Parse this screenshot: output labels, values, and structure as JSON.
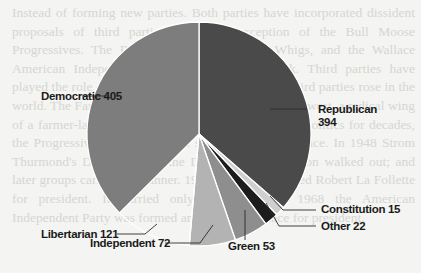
{
  "background_text": "Instead of forming new parties. Both parties have incorporated dissident proposals of third parties, with the exception of the Bull Moose Progressives. The Republicans absorbed the Whigs, and the Wallace American Independents brought Democrats back. Third parties have played the role of protest. In the twentieth century, third parties rose in the world. The Farm Labor Party formed in the upper Midwest, a radical wing of a farmer-labor movement that became the way of politics for decades, the Progressives won 1948 as a splinter. Henry Wallace. In 1948 Strom Thurmond's Dixiecrats and the Democratic convention walked out; and later groups carried the banner. 1924, which nominated Robert La Follette for president. It carried only Wisconsin. In 1968 the American Independent Party was formed and George Wallace for president.",
  "chart_data": {
    "type": "pie",
    "title": "",
    "total": 1082,
    "start_angle_deg": 0,
    "direction": "clockwise",
    "categories": [
      "Republican",
      "Constitution",
      "Other",
      "Green",
      "Independent",
      "Libertarian",
      "Democratic"
    ],
    "values": [
      394,
      15,
      22,
      53,
      72,
      121,
      405
    ],
    "colors": [
      "#4a4a4a",
      "#cfcfcf",
      "#1c1c1c",
      "#8e8e8e",
      "#b3b3b3",
      "#ffffff",
      "#7d7d7d"
    ],
    "labels": [
      {
        "name": "Republican",
        "line1": "Republican",
        "line2": "394"
      },
      {
        "name": "Constitution",
        "line1": "Constitution 15"
      },
      {
        "name": "Other",
        "line1": "Other 22"
      },
      {
        "name": "Green",
        "line1": "Green 53"
      },
      {
        "name": "Independent",
        "line1": "Independent 72"
      },
      {
        "name": "Libertarian",
        "line1": "Libertarian 121"
      },
      {
        "name": "Democratic",
        "line1": "Democratic 405"
      }
    ],
    "legend": "none (direct labels with leader lines)"
  }
}
